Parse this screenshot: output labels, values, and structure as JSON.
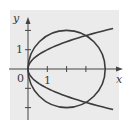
{
  "figure": {
    "background": "#ffffff",
    "panel_color": "#ebebeb",
    "curve_color": "#3c3c3c",
    "axis_color": "#444444"
  },
  "axes": {
    "x_label": "x",
    "y_label": "y",
    "origin_label": "0",
    "x_tick_label": "1",
    "y_tick_label": "1"
  },
  "chart_data": {
    "type": "line",
    "title": "",
    "xlabel": "x",
    "ylabel": "y",
    "xlim": [
      -0.9,
      4.8
    ],
    "ylim": [
      -2.6,
      2.6
    ],
    "grid": false,
    "x_ticks": [
      1,
      2,
      3
    ],
    "x_tick_labels": [
      "1"
    ],
    "y_ticks": [
      1,
      -1,
      -2,
      2
    ],
    "y_tick_labels": [
      "1"
    ],
    "series": [
      {
        "name": "circle (x-2)^2 + y^2 = 4",
        "kind": "circle",
        "center": [
          2,
          0
        ],
        "radius": 2
      },
      {
        "name": "parabola x = y^2",
        "kind": "parabola",
        "y_range": [
          -2.1,
          2.1
        ]
      }
    ],
    "intersections": [
      [
        0,
        0
      ],
      [
        3,
        1.732
      ],
      [
        3,
        -1.732
      ]
    ]
  }
}
